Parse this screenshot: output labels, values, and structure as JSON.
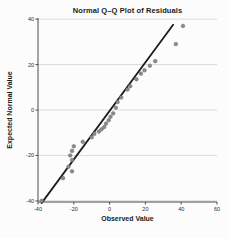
{
  "figure": {
    "title": "Normal Q–Q Plot of Residuals",
    "xlabel": "Observed Value",
    "ylabel": "Expected Normal Value"
  },
  "chart_data": {
    "type": "scatter",
    "title": "Normal Q–Q Plot of Residuals",
    "xlabel": "Observed Value",
    "ylabel": "Expected Normal Value",
    "xlim": [
      -40,
      60
    ],
    "ylim": [
      -40.5,
      40.5
    ],
    "x_ticks": [
      -40,
      -20,
      0,
      20,
      40,
      60
    ],
    "y_ticks": [
      -40,
      -20,
      0,
      20,
      40
    ],
    "grid": "horizontal",
    "legend": "none",
    "points": [
      [
        -38,
        -40
      ],
      [
        -26,
        -30
      ],
      [
        -21,
        -27
      ],
      [
        -23,
        -25
      ],
      [
        -21,
        -22
      ],
      [
        -22,
        -20
      ],
      [
        -21,
        -18
      ],
      [
        -20,
        -16
      ],
      [
        -15,
        -14
      ],
      [
        -10,
        -12
      ],
      [
        -8.5,
        -10.5
      ],
      [
        -6,
        -9.5
      ],
      [
        -4.5,
        -8.5
      ],
      [
        -3,
        -7.5
      ],
      [
        -2,
        -6
      ],
      [
        -0.5,
        -4.5
      ],
      [
        0.5,
        -3
      ],
      [
        2,
        -1.5
      ],
      [
        3.5,
        1
      ],
      [
        4.5,
        3.5
      ],
      [
        6.5,
        5.5
      ],
      [
        10,
        9
      ],
      [
        11.5,
        10.5
      ],
      [
        15,
        13.5
      ],
      [
        17.5,
        16
      ],
      [
        19.5,
        17.5
      ],
      [
        22.5,
        19.5
      ],
      [
        25.5,
        21.5
      ],
      [
        37,
        29
      ],
      [
        41,
        37
      ]
    ],
    "trend_line": {
      "x1": -38,
      "y1": -41,
      "x2": 35.5,
      "y2": 37.5
    },
    "colors": {
      "point_fill": "#8c8c8c",
      "point_stroke": "#6e6e6e",
      "line": "#1c1c1c",
      "grid": "#dadada",
      "axis": "#4a4a4a",
      "tick_text": "#2b2b2b",
      "background": "#fcfcfc"
    }
  }
}
